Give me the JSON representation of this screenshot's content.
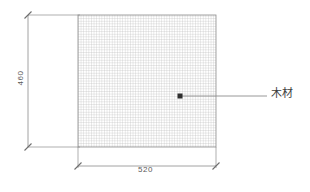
{
  "canvas": {
    "width": 310,
    "height": 192,
    "background": "#ffffff"
  },
  "drawing": {
    "type": "technical-dimension-drawing",
    "line_color": "#8c8c8c",
    "hatch_color": "#b0b0b0",
    "text_color": "#5a5a5a",
    "part": {
      "shape": "rectangle",
      "fill_pattern": "cross-hatch-grid",
      "x": 78,
      "y": 15,
      "width": 138,
      "height": 132
    }
  },
  "dimensions": {
    "vertical": {
      "value": "460",
      "orientation": "vertical",
      "line_x": 28,
      "from_y": 15,
      "to_y": 147
    },
    "horizontal": {
      "value": "520",
      "orientation": "horizontal",
      "line_y": 166,
      "from_x": 78,
      "to_x": 216
    }
  },
  "annotation": {
    "label": "木材",
    "marker": {
      "x": 180,
      "y": 96
    },
    "leader_from_x": 180,
    "leader_to_x": 267,
    "leader_y": 96
  }
}
